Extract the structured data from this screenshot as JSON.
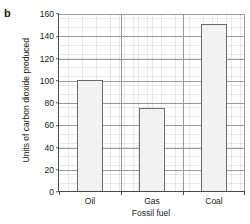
{
  "panel": {
    "label": "b"
  },
  "chart_data": {
    "type": "bar",
    "title": "",
    "xlabel": "Fossil fuel",
    "ylabel": "Units of carbon dioxide produced",
    "categories": [
      "Oil",
      "Gas",
      "Coal"
    ],
    "values": [
      100,
      75,
      150
    ],
    "ylim": [
      0,
      160
    ],
    "ytick_values": [
      0,
      20,
      40,
      60,
      80,
      100,
      120,
      140,
      160
    ],
    "ytick_labels": [
      "0",
      "20",
      "40",
      "60",
      "80",
      "100",
      "120",
      "140",
      "160"
    ],
    "grid": "major and fine minor grid, both axes",
    "legend": "none",
    "bar_fill_color": "#f2f2f2",
    "bar_edge_color": "#6b6b6b",
    "grid_color": "#9a9a9a",
    "axis_color": "#4a4a4a"
  }
}
